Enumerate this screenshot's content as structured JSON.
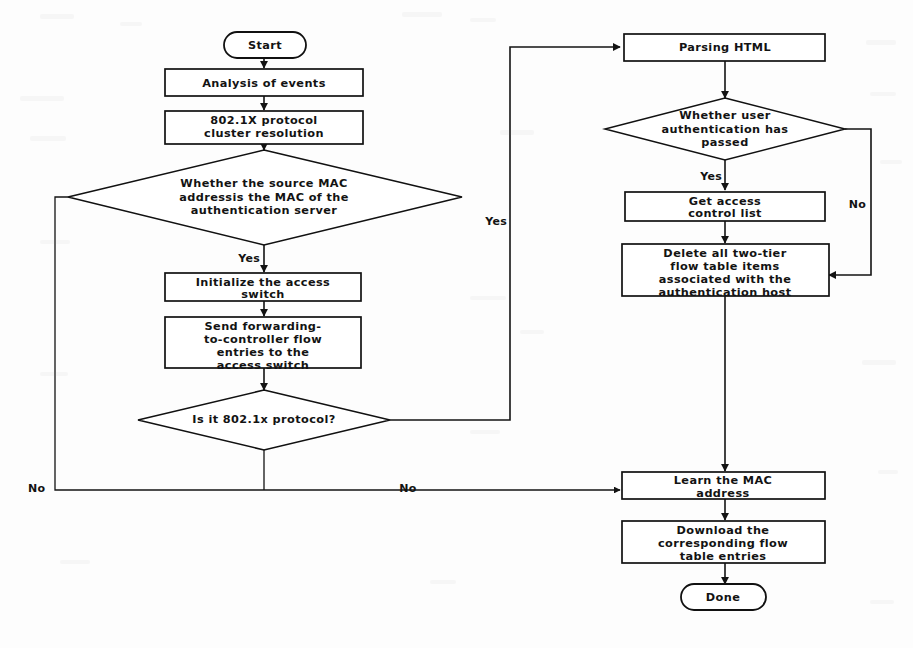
{
  "diagram": {
    "background_color": "#fdfdfd",
    "line_color": "#131313",
    "node_fill": "#ffffff",
    "nodes": {
      "start": {
        "label": "Start",
        "type": "terminator"
      },
      "analysis_of_events": {
        "label": "Analysis of events",
        "type": "process"
      },
      "protocol_cluster": {
        "line1": "802.1X protocol",
        "line2": "cluster resolution",
        "type": "process"
      },
      "source_mac_decision": {
        "line1": "Whether the source MAC",
        "line2": "addressis the MAC of the",
        "line3": "authentication server",
        "type": "decision"
      },
      "initialize_switch": {
        "line1": "Initialize the access",
        "line2": "switch",
        "type": "process"
      },
      "send_forwarding": {
        "line1": "Send forwarding-",
        "line2": "to-controller flow",
        "line3": "entries to the",
        "line4": "access switch",
        "type": "process"
      },
      "is_8021x_decision": {
        "label": "Is it 802.1x protocol?",
        "type": "decision"
      },
      "parsing_html": {
        "label": "Parsing HTML",
        "type": "process"
      },
      "user_auth_decision": {
        "line1": "Whether user",
        "line2": "authentication has",
        "line3": "passed",
        "type": "decision"
      },
      "get_access_control_list": {
        "line1": "Get access",
        "line2": "control list",
        "type": "process"
      },
      "delete_flow_items": {
        "line1": "Delete all two-tier",
        "line2": "flow table items",
        "line3": "associated with the",
        "line4": "authentication host",
        "type": "process"
      },
      "learn_mac": {
        "line1": "Learn the MAC",
        "line2": "address",
        "type": "process"
      },
      "download_flow_entries": {
        "line1": "Download the",
        "line2": "corresponding flow",
        "line3": "table entries",
        "type": "process"
      },
      "done": {
        "label": "Done",
        "type": "terminator"
      }
    },
    "edge_labels": {
      "source_mac_yes": "Yes",
      "source_mac_no": "No",
      "is_8021x_yes": "Yes",
      "is_8021x_no": "No",
      "user_auth_yes": "Yes",
      "user_auth_no": "No"
    }
  }
}
